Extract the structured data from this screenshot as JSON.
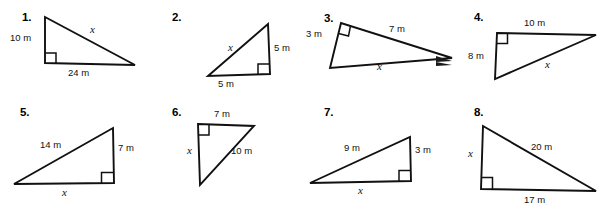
{
  "worksheet": {
    "background_color": "#ffffff",
    "ink_color": "#111111",
    "unit": "m",
    "unknown_label": "x"
  },
  "problems": [
    {
      "number": "1.",
      "labels": {
        "leg_vertical": "10 m",
        "leg_horizontal": "24 m",
        "hypotenuse": "x"
      }
    },
    {
      "number": "2.",
      "labels": {
        "leg_vertical": "5 m",
        "leg_horizontal": "5 m",
        "hypotenuse": "x"
      }
    },
    {
      "number": "3.",
      "labels": {
        "leg_short": "3 m",
        "leg_long": "7 m",
        "hypotenuse": "x"
      }
    },
    {
      "number": "4.",
      "labels": {
        "leg_horizontal": "10 m",
        "leg_vertical": "8 m",
        "hypotenuse": "x"
      }
    },
    {
      "number": "5.",
      "labels": {
        "hypotenuse": "14 m",
        "leg_vertical": "7 m",
        "leg_horizontal": "x"
      }
    },
    {
      "number": "6.",
      "labels": {
        "leg_horizontal": "7 m",
        "hypotenuse": "10 m",
        "leg_vertical": "x"
      }
    },
    {
      "number": "7.",
      "labels": {
        "hypotenuse": "9 m",
        "leg_vertical": "3 m",
        "leg_horizontal": "x"
      }
    },
    {
      "number": "8.",
      "labels": {
        "hypotenuse": "20 m",
        "leg_horizontal": "17 m",
        "leg_vertical": "x"
      }
    }
  ]
}
